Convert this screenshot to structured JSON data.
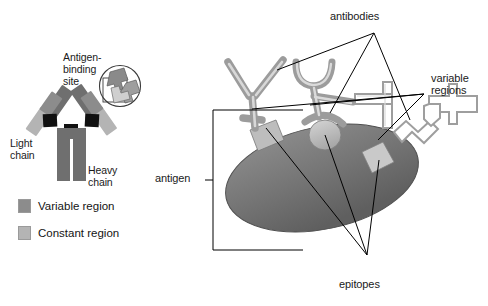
{
  "figure": {
    "background": "#ffffff"
  },
  "left_panel": {
    "antigen_binding_site_label": "Antigen-\nbinding\nsite",
    "light_chain_label": "Light\nchain",
    "heavy_chain_label": "Heavy\nchain",
    "legend": [
      {
        "label": "Variable region",
        "color": "#8c8c8c"
      },
      {
        "label": "Constant region",
        "color": "#b4b4b4"
      }
    ]
  },
  "right_panel": {
    "antibodies_label": "antibodies",
    "variable_regions_label": "variable\nregions",
    "antigen_label": "antigen",
    "epitopes_label": "epitopes"
  },
  "colors": {
    "variable_region": "#8c8c8c",
    "constant_region": "#b4b4b4",
    "hinge": "#111111",
    "antigen_body": "#6e6e6e",
    "antigen_body_light": "#8f8f8f",
    "epitope": "#c2c2c2",
    "antibody_fill": "#b9b9b9",
    "antibody_outline": "#8a8a8a",
    "leader_line": "#000000",
    "text": "#1a1a1a"
  }
}
